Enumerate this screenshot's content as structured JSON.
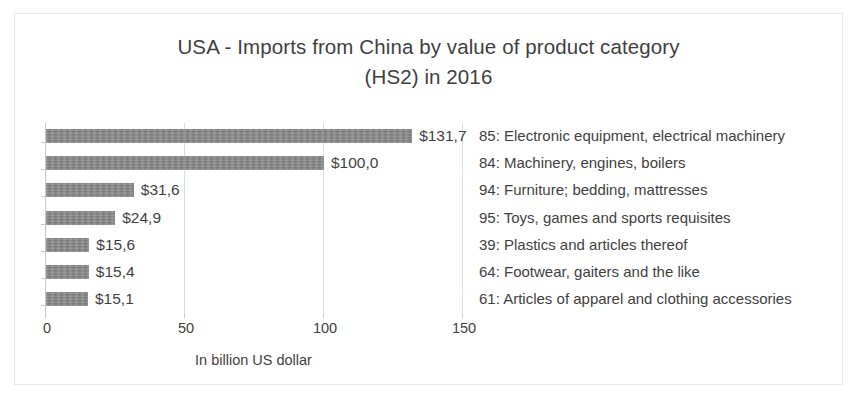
{
  "chart_data": {
    "type": "bar",
    "orientation": "horizontal",
    "title": "USA - Imports from China by value of product category (HS2) in 2016",
    "title_lines": [
      "USA - Imports from China by value of product category",
      "(HS2) in 2016"
    ],
    "xlabel": "In billion US dollar",
    "ylabel": "",
    "xlim": [
      0,
      150
    ],
    "xticks": [
      0,
      50,
      100,
      150
    ],
    "xtick_labels": [
      "0",
      "50",
      "100",
      "150"
    ],
    "grid": true,
    "legend": "none",
    "bar_color": "#818181",
    "categories": [
      "85: Electronic equipment, electrical machinery",
      "84: Machinery, engines, boilers",
      "94: Furniture; bedding, mattresses",
      "95: Toys, games and sports requisites",
      "39: Plastics and articles thereof",
      "64: Footwear, gaiters and the like",
      "61: Articles of apparel and clothing accessories"
    ],
    "values": [
      131.7,
      100.0,
      31.6,
      24.9,
      15.6,
      15.4,
      15.1
    ],
    "value_labels": [
      "$131,7",
      "$100,0",
      "$31,6",
      "$24,9",
      "$15,6",
      "$15,4",
      "$15,1"
    ]
  }
}
